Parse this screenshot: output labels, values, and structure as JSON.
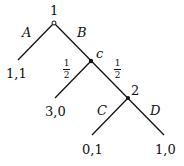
{
  "tree": {
    "root": {
      "player": "1",
      "type": "decision"
    },
    "edges": [
      {
        "from": "1",
        "to": "leaf_A",
        "label": "A"
      },
      {
        "from": "1",
        "to": "c",
        "label": "B"
      },
      {
        "from": "c",
        "to": "leaf_left",
        "label": "1/2",
        "num": "1",
        "den": "2"
      },
      {
        "from": "c",
        "to": "2",
        "label": "1/2",
        "num": "1",
        "den": "2"
      },
      {
        "from": "2",
        "to": "leaf_C",
        "label": "C"
      },
      {
        "from": "2",
        "to": "leaf_D",
        "label": "D"
      }
    ],
    "nodes": {
      "root_label": "1",
      "chance_label": "c",
      "player2_label": "2"
    },
    "payoffs": {
      "A": "1,1",
      "chance_left": "3,0",
      "C": "0,1",
      "D": "1,0"
    }
  }
}
